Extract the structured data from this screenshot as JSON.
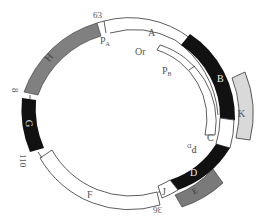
{
  "diagram": {
    "type": "circular genome map",
    "position_markers": [
      "63",
      "8",
      "110",
      "36"
    ],
    "segments": [
      {
        "id": "A",
        "label": "A",
        "fill": "#ffffff",
        "ring": "inner-white"
      },
      {
        "id": "B",
        "label": "B",
        "fill": "#111111",
        "ring": "main"
      },
      {
        "id": "C",
        "label": "C",
        "fill": "#ffffff",
        "ring": "main"
      },
      {
        "id": "D",
        "label": "D",
        "fill": "#111111",
        "ring": "main"
      },
      {
        "id": "E",
        "label": "E",
        "fill": "#7a7a7a",
        "ring": "outer"
      },
      {
        "id": "F",
        "label": "F",
        "fill": "#ffffff",
        "ring": "main"
      },
      {
        "id": "G",
        "label": "G",
        "fill": "#111111",
        "ring": "main"
      },
      {
        "id": "H",
        "label": "H",
        "fill": "#808080",
        "ring": "main"
      },
      {
        "id": "J",
        "label": "J",
        "fill": "#ffffff",
        "ring": "main"
      },
      {
        "id": "K",
        "label": "K",
        "fill": "#d9d9d9",
        "ring": "outer"
      }
    ],
    "promoters": [
      "PA",
      "PB",
      "PD"
    ],
    "origin": "Or",
    "labels": {
      "m63": "63",
      "m8": "8",
      "m110": "110",
      "m36": "36",
      "A": "A",
      "B": "B",
      "C": "C",
      "D": "D",
      "E": "E",
      "F": "F",
      "G": "G",
      "H": "H",
      "J": "J",
      "K": "K",
      "PA": "P",
      "PA_sub": "A",
      "PB": "P",
      "PB_sub": "B",
      "PD": "P",
      "PD_sub": "D",
      "Or": "Or"
    }
  }
}
